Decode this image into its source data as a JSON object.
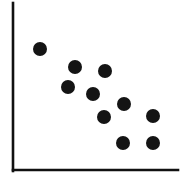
{
  "figure": {
    "title": "",
    "background_color": "#ffffff",
    "width": 182,
    "height": 184
  },
  "axes": {
    "color": "#111111",
    "line_width": 2.6,
    "y_axis": {
      "name": "y-axis-line",
      "x": 13,
      "y_top": 3,
      "y_bottom": 171
    },
    "x_axis": {
      "name": "x-axis-line",
      "y": 170,
      "x_left": 13,
      "x_right": 178
    }
  },
  "marker": {
    "shape": "circle",
    "radius": 7,
    "color": "#141414"
  },
  "chart_data": {
    "type": "scatter",
    "title": "",
    "xlabel": "",
    "ylabel": "",
    "xlim": [
      0,
      10
    ],
    "ylim": [
      0,
      10
    ],
    "grid": false,
    "legend": null,
    "tick_labels_x": [],
    "tick_labels_y": [],
    "annotations": [],
    "trend": "negative",
    "series": [
      {
        "name": "points",
        "color": "#141414",
        "marker": "circle",
        "x": [
          1.64,
          3.76,
          3.33,
          5.58,
          4.85,
          6.73,
          5.52,
          8.48,
          6.67,
          8.48
        ],
        "y": [
          7.26,
          6.13,
          4.94,
          5.89,
          4.52,
          3.93,
          3.15,
          3.21,
          1.61,
          1.61
        ],
        "points_px": [
          {
            "cx": 40,
            "cy": 49
          },
          {
            "cx": 75,
            "cy": 67
          },
          {
            "cx": 68,
            "cy": 87
          },
          {
            "cx": 105,
            "cy": 71
          },
          {
            "cx": 93,
            "cy": 94
          },
          {
            "cx": 124,
            "cy": 104
          },
          {
            "cx": 104,
            "cy": 117
          },
          {
            "cx": 153,
            "cy": 116
          },
          {
            "cx": 123,
            "cy": 143
          },
          {
            "cx": 153,
            "cy": 143
          }
        ]
      }
    ]
  }
}
